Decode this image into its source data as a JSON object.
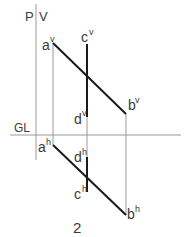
{
  "diagram": {
    "plane_labels": {
      "p": "P",
      "v": "V",
      "gl": "GL"
    },
    "figure_number": "2",
    "points": {
      "a_v": {
        "base": "a",
        "sup": "v"
      },
      "b_v": {
        "base": "b",
        "sup": "v"
      },
      "c_v": {
        "base": "c",
        "sup": "v"
      },
      "d_v": {
        "base": "d",
        "sup": "v"
      },
      "a_h": {
        "base": "a",
        "sup": "h"
      },
      "b_h": {
        "base": "b",
        "sup": "h"
      },
      "c_h": {
        "base": "c",
        "sup": "h"
      },
      "d_h": {
        "base": "d",
        "sup": "h"
      }
    },
    "colors": {
      "thick_line": "#1a1a1a",
      "thin_line": "#8a8a8a",
      "text": "#3a3a3a"
    }
  }
}
